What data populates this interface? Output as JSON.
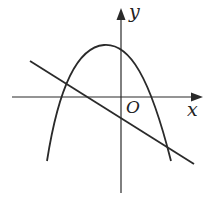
{
  "diagram": {
    "type": "function-graph",
    "axes": {
      "x_label": "x",
      "y_label": "y",
      "origin_label": "O"
    },
    "curves": [
      {
        "name": "parabola",
        "shape": "downward-opening",
        "vertex_side": "left of y-axis, above x-axis",
        "y_intercept": "positive"
      },
      {
        "name": "line",
        "slope": "negative",
        "y_intercept": "negative"
      }
    ],
    "colors": {
      "stroke": "#2a2a2a",
      "background": "#ffffff"
    }
  }
}
